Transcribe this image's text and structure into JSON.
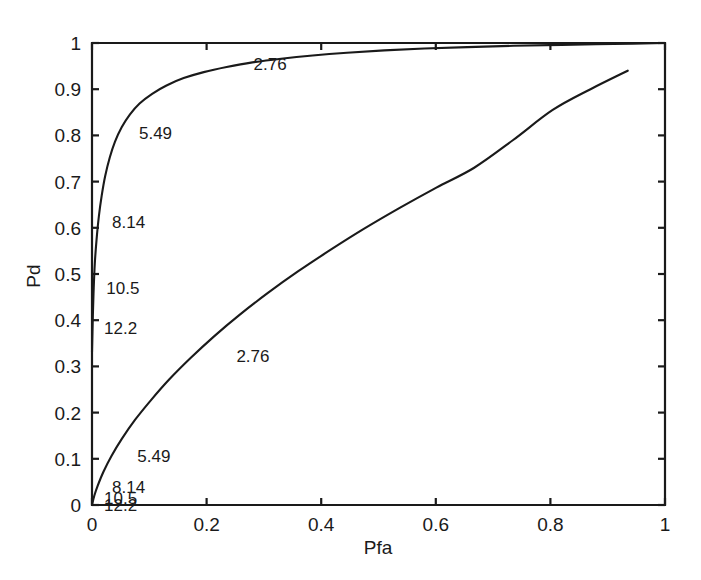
{
  "chart_data": {
    "type": "line",
    "title": "",
    "xlabel": "Pfa",
    "ylabel": "Pd",
    "xlim": [
      0,
      1
    ],
    "ylim": [
      0,
      1
    ],
    "grid": false,
    "legend": "none",
    "xticks": [
      "0",
      "0.2",
      "0.4",
      "0.6",
      "0.8",
      "1"
    ],
    "xtick_values": [
      0,
      0.2,
      0.4,
      0.6,
      0.8,
      1
    ],
    "yticks": [
      "0",
      "0.1",
      "0.2",
      "0.3",
      "0.4",
      "0.5",
      "0.6",
      "0.7",
      "0.8",
      "0.9",
      "1"
    ],
    "ytick_values": [
      0,
      0.1,
      0.2,
      0.3,
      0.4,
      0.5,
      0.6,
      0.7,
      0.8,
      0.9,
      1
    ],
    "series": [
      {
        "name": "upper-roc-curve",
        "x": [
          0.0,
          0.0015,
          0.003,
          0.005,
          0.008,
          0.012,
          0.017,
          0.023,
          0.031,
          0.04,
          0.052,
          0.066,
          0.083,
          0.105,
          0.13,
          0.16,
          0.195,
          0.235,
          0.28,
          0.33,
          0.385,
          0.445,
          0.51,
          0.58,
          0.655,
          0.735,
          0.82,
          0.91,
          1.0
        ],
        "y": [
          0.33,
          0.41,
          0.47,
          0.525,
          0.575,
          0.625,
          0.67,
          0.712,
          0.752,
          0.786,
          0.818,
          0.845,
          0.869,
          0.89,
          0.908,
          0.924,
          0.937,
          0.948,
          0.958,
          0.966,
          0.973,
          0.979,
          0.984,
          0.988,
          0.991,
          0.994,
          0.996,
          0.998,
          1.0
        ]
      },
      {
        "name": "lower-roc-curve",
        "x": [
          0.0,
          0.004,
          0.01,
          0.02,
          0.034,
          0.052,
          0.075,
          0.103,
          0.135,
          0.172,
          0.213,
          0.258,
          0.307,
          0.36,
          0.416,
          0.475,
          0.537,
          0.601,
          0.667,
          0.735,
          0.804,
          0.87,
          0.935
        ],
        "y": [
          0.0,
          0.02,
          0.042,
          0.072,
          0.106,
          0.143,
          0.184,
          0.227,
          0.272,
          0.318,
          0.365,
          0.412,
          0.459,
          0.506,
          0.552,
          0.598,
          0.643,
          0.687,
          0.73,
          0.79,
          0.855,
          0.9,
          0.94
        ]
      }
    ],
    "annotations": [
      {
        "id": "upper-2-76",
        "text": "2.76",
        "x": 0.275,
        "y": 0.955,
        "curve": "upper-roc-curve"
      },
      {
        "id": "upper-5-49",
        "text": "5.49",
        "x": 0.075,
        "y": 0.805,
        "curve": "upper-roc-curve"
      },
      {
        "id": "upper-8-14",
        "text": "8.14",
        "x": 0.028,
        "y": 0.612,
        "curve": "upper-roc-curve"
      },
      {
        "id": "upper-10-5",
        "text": "10.5",
        "x": 0.018,
        "y": 0.47,
        "curve": "upper-roc-curve"
      },
      {
        "id": "upper-12-2",
        "text": "12.2",
        "x": 0.014,
        "y": 0.383,
        "curve": "upper-roc-curve"
      },
      {
        "id": "lower-2-76",
        "text": "2.76",
        "x": 0.245,
        "y": 0.322,
        "curve": "lower-roc-curve"
      },
      {
        "id": "lower-5-49",
        "text": "5.49",
        "x": 0.072,
        "y": 0.105,
        "curve": "lower-roc-curve"
      },
      {
        "id": "lower-8-14",
        "text": "8.14",
        "x": 0.028,
        "y": 0.04,
        "curve": "lower-roc-curve"
      },
      {
        "id": "lower-10-5",
        "text": "10.5",
        "x": 0.014,
        "y": 0.016,
        "curve": "lower-roc-curve"
      },
      {
        "id": "lower-12-2",
        "text": "12.2",
        "x": 0.014,
        "y": 0.0,
        "curve": "lower-roc-curve"
      }
    ],
    "colors": {
      "curve": "#1a1a1a",
      "axis": "#1a1a1a",
      "background": "#ffffff",
      "text": "#1a1a1a"
    }
  }
}
